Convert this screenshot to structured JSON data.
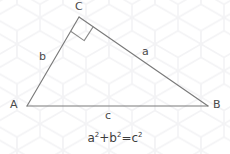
{
  "figure": {
    "type": "right-triangle-diagram",
    "background_pattern": "hexagon-honeycomb-watermark",
    "line_color": "#7a7a7a",
    "text_color": "#4a4a4a",
    "background_color": "#ffffff",
    "hex_color": "#f4f4f6",
    "vertices": [
      {
        "name": "A",
        "label": "A",
        "x": 27,
        "y": 106,
        "label_x": 10,
        "label_y": 99
      },
      {
        "name": "B",
        "label": "B",
        "x": 208,
        "y": 106,
        "label_x": 213,
        "label_y": 99
      },
      {
        "name": "C",
        "label": "C",
        "x": 79,
        "y": 17,
        "label_x": 75,
        "label_y": 1
      }
    ],
    "sides": [
      {
        "name": "a",
        "label": "a",
        "from": "C",
        "to": "B",
        "label_x": 142,
        "label_y": 46
      },
      {
        "name": "b",
        "label": "b",
        "from": "A",
        "to": "C",
        "label_x": 39,
        "label_y": 51
      },
      {
        "name": "c",
        "label": "c",
        "from": "A",
        "to": "B",
        "label_x": 105,
        "label_y": 110
      }
    ],
    "right_angle": {
      "at_vertex": "C",
      "marker": "square",
      "size": 16
    }
  },
  "formula": {
    "base_a": "a",
    "exp_a": "2",
    "plus": "+",
    "base_b": "b",
    "exp_b": "2",
    "equals": "=",
    "base_c": "c",
    "exp_c": "2",
    "full_text": "a²+b²=c²"
  }
}
